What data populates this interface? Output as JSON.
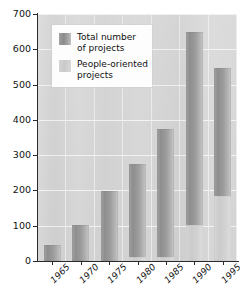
{
  "chart_data": {
    "type": "bar",
    "title": "",
    "subtitle": "",
    "xlabel": "",
    "ylabel": "",
    "categories": [
      "1965",
      "1970",
      "1975",
      "1980",
      "1985",
      "1990",
      "1995"
    ],
    "series": [
      {
        "name": "Total number of projects",
        "color": "#949494",
        "values": [
          45,
          103,
          197,
          275,
          375,
          648,
          548
        ]
      },
      {
        "name": "People-oriented projects",
        "color": "#d2d2d2",
        "values": [
          0,
          0,
          0,
          10,
          10,
          103,
          185
        ]
      }
    ],
    "stacked_overlay": true,
    "ylim": [
      0,
      700
    ],
    "ytick_values": [
      0,
      100,
      200,
      300,
      400,
      500,
      600,
      700
    ],
    "ytick_labels": [
      "0",
      "100",
      "200",
      "300",
      "400",
      "500",
      "600",
      "700"
    ],
    "grid": "horizontal-and-vertical",
    "legend_position": "top-left",
    "xtick_label_rotation": -45
  },
  "legend": {
    "items": [
      {
        "label": "Total number\nof projects",
        "swatch": "dark-gray-swatch"
      },
      {
        "label": "People-oriented\nprojects",
        "swatch": "light-gray-swatch"
      }
    ]
  },
  "colors": {
    "plot_background": "#d6d6d6",
    "gridline": "#f4f4f4",
    "axis": "#2b2b2b",
    "bar_total": "#949494",
    "bar_people": "#d2d2d2",
    "legend_background": "#fdfdfd",
    "text": "#111111"
  }
}
